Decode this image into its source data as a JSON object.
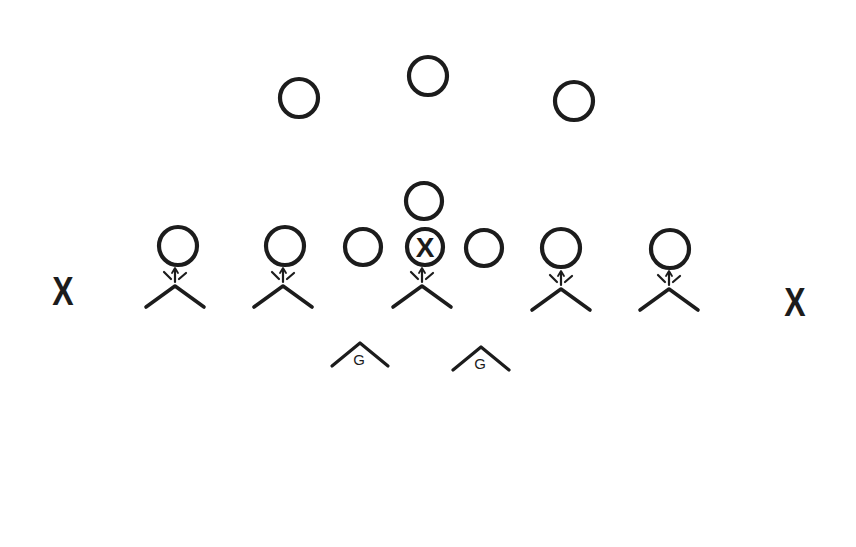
{
  "diagram": {
    "type": "football-formation",
    "background": "#ffffff",
    "ink_color": "#1c1c1c",
    "offense": {
      "players": [
        {
          "id": "back-left",
          "x": 299,
          "y": 98,
          "r": 19
        },
        {
          "id": "back-center",
          "x": 428,
          "y": 76,
          "r": 19
        },
        {
          "id": "back-right",
          "x": 574,
          "y": 101,
          "r": 19
        },
        {
          "id": "quarterback",
          "x": 424,
          "y": 201,
          "r": 18
        },
        {
          "id": "left-end",
          "x": 178,
          "y": 246,
          "r": 19
        },
        {
          "id": "left-tackle",
          "x": 285,
          "y": 246,
          "r": 19
        },
        {
          "id": "left-guard",
          "x": 363,
          "y": 247,
          "r": 18
        },
        {
          "id": "center",
          "x": 425,
          "y": 247,
          "r": 18,
          "label": "X"
        },
        {
          "id": "right-guard",
          "x": 484,
          "y": 248,
          "r": 18
        },
        {
          "id": "right-tackle",
          "x": 561,
          "y": 248,
          "r": 19
        },
        {
          "id": "right-end",
          "x": 670,
          "y": 249,
          "r": 19
        }
      ]
    },
    "defense": {
      "linemen": [
        {
          "id": "def-left-end",
          "x": 175,
          "y": 286,
          "w": 58,
          "h": 21
        },
        {
          "id": "def-left-tackle",
          "x": 283,
          "y": 286,
          "w": 58,
          "h": 21
        },
        {
          "id": "def-nose",
          "x": 422,
          "y": 286,
          "w": 58,
          "h": 21
        },
        {
          "id": "def-right-tackle",
          "x": 561,
          "y": 289,
          "w": 58,
          "h": 21
        },
        {
          "id": "def-right-end",
          "x": 669,
          "y": 289,
          "w": 58,
          "h": 21
        }
      ],
      "guards": [
        {
          "id": "g-left",
          "x": 360,
          "y": 343,
          "w": 56,
          "h": 23,
          "label": "G"
        },
        {
          "id": "g-right",
          "x": 481,
          "y": 347,
          "w": 56,
          "h": 23,
          "label": "G"
        }
      ],
      "wide": [
        {
          "id": "x-left",
          "x": 63,
          "y": 291,
          "label": "X"
        },
        {
          "id": "x-right",
          "x": 795,
          "y": 302,
          "label": "X"
        }
      ]
    },
    "contact_marks": {
      "description": "three short strokes between each lineman and the opposing circle, center one with arrowhead",
      "targets": [
        "def-left-end",
        "def-left-tackle",
        "def-nose",
        "def-right-tackle",
        "def-right-end"
      ]
    }
  }
}
